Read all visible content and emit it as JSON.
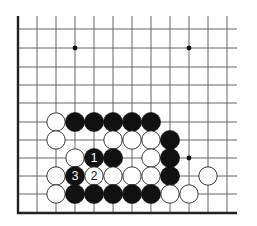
{
  "diagram": {
    "type": "go-board-problem",
    "colors": {
      "background": "#ffffff",
      "line": "#555555",
      "edge": "#222222",
      "black": "#111111",
      "white": "#ffffff"
    },
    "grid": {
      "cols_x": [
        18,
        37,
        56,
        75,
        94,
        113,
        132,
        151,
        170,
        189,
        208,
        227
      ],
      "rows_y": [
        29,
        48,
        67,
        85,
        103,
        122,
        140,
        158,
        176,
        194,
        213
      ],
      "top": 16,
      "right": 237
    },
    "star_points": [
      {
        "col": 3,
        "row": 1
      },
      {
        "col": 9,
        "row": 1
      },
      {
        "col": 9,
        "row": 7
      }
    ],
    "stones": [
      {
        "color": "white",
        "col": 2,
        "row": 5
      },
      {
        "color": "black",
        "col": 3,
        "row": 5
      },
      {
        "color": "black",
        "col": 4,
        "row": 5
      },
      {
        "color": "black",
        "col": 5,
        "row": 5
      },
      {
        "color": "black",
        "col": 6,
        "row": 5
      },
      {
        "color": "black",
        "col": 7,
        "row": 5
      },
      {
        "color": "white",
        "col": 2,
        "row": 6
      },
      {
        "color": "white",
        "col": 5,
        "row": 6
      },
      {
        "color": "white",
        "col": 6,
        "row": 6
      },
      {
        "color": "white",
        "col": 7,
        "row": 6
      },
      {
        "color": "black",
        "col": 8,
        "row": 6
      },
      {
        "color": "white",
        "col": 3,
        "row": 7
      },
      {
        "color": "black",
        "col": 4,
        "row": 7,
        "label": "1"
      },
      {
        "color": "black",
        "col": 5,
        "row": 7
      },
      {
        "color": "white",
        "col": 7,
        "row": 7
      },
      {
        "color": "black",
        "col": 8,
        "row": 7
      },
      {
        "color": "white",
        "col": 2,
        "row": 8
      },
      {
        "color": "black",
        "col": 3,
        "row": 8,
        "label": "3"
      },
      {
        "color": "white",
        "col": 4,
        "row": 8,
        "label": "2"
      },
      {
        "color": "white",
        "col": 5,
        "row": 8
      },
      {
        "color": "white",
        "col": 6,
        "row": 8
      },
      {
        "color": "white",
        "col": 7,
        "row": 8
      },
      {
        "color": "black",
        "col": 8,
        "row": 8
      },
      {
        "color": "white",
        "col": 10,
        "row": 8
      },
      {
        "color": "white",
        "col": 2,
        "row": 9
      },
      {
        "color": "black",
        "col": 3,
        "row": 9
      },
      {
        "color": "black",
        "col": 4,
        "row": 9
      },
      {
        "color": "black",
        "col": 5,
        "row": 9
      },
      {
        "color": "black",
        "col": 6,
        "row": 9
      },
      {
        "color": "black",
        "col": 7,
        "row": 9
      },
      {
        "color": "white",
        "col": 8,
        "row": 9
      },
      {
        "color": "white",
        "col": 9,
        "row": 9
      }
    ],
    "move_labels": [
      "1",
      "2",
      "3"
    ]
  }
}
